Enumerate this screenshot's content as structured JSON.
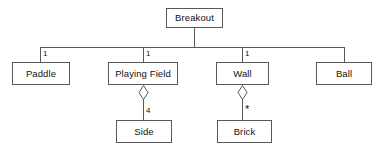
{
  "diagram": {
    "type": "uml-class-diagram",
    "title": "Breakout",
    "stroke_color": "#58585a",
    "fill_color": "#ffffff",
    "text_color": "#111111",
    "nodes": {
      "root": {
        "label": "Breakout"
      },
      "paddle": {
        "label": "Paddle"
      },
      "playing_field": {
        "label": "Playing Field"
      },
      "wall": {
        "label": "Wall"
      },
      "ball": {
        "label": "Ball"
      },
      "side": {
        "label": "Side"
      },
      "brick": {
        "label": "Brick"
      }
    },
    "multiplicities": {
      "root_paddle": "1",
      "root_playing_field": "1",
      "root_wall": "1",
      "root_ball": "",
      "playing_field_side": "4",
      "wall_brick": "*"
    },
    "relations": [
      {
        "from": "Breakout",
        "to": "Paddle",
        "kind": "association",
        "multiplicity": "1"
      },
      {
        "from": "Breakout",
        "to": "Playing Field",
        "kind": "association",
        "multiplicity": "1"
      },
      {
        "from": "Breakout",
        "to": "Wall",
        "kind": "association",
        "multiplicity": "1"
      },
      {
        "from": "Breakout",
        "to": "Ball",
        "kind": "association",
        "multiplicity": ""
      },
      {
        "from": "Playing Field",
        "to": "Side",
        "kind": "aggregation",
        "multiplicity": "4"
      },
      {
        "from": "Wall",
        "to": "Brick",
        "kind": "aggregation",
        "multiplicity": "*"
      }
    ]
  }
}
